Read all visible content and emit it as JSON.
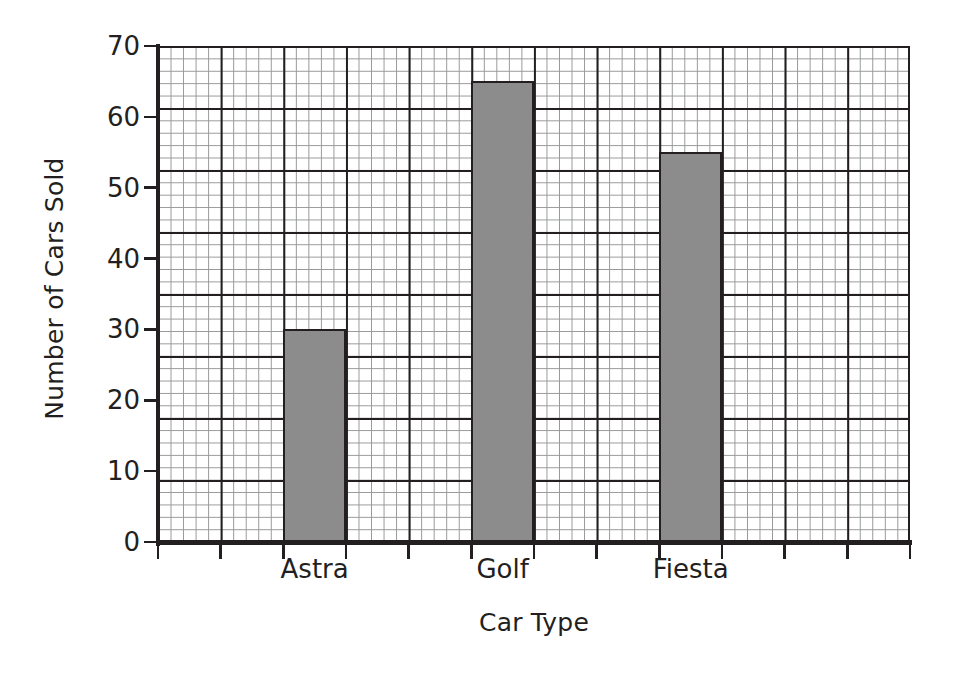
{
  "chart_data": {
    "type": "bar",
    "title": "",
    "xlabel": "Car Type",
    "ylabel": "Number of Cars Sold",
    "categories": [
      "Astra",
      "Golf",
      "Fiesta"
    ],
    "values": [
      30,
      65,
      55
    ],
    "ylim": [
      0,
      70
    ],
    "ytick_step": 10,
    "yticks": [
      0,
      10,
      20,
      30,
      40,
      50,
      60,
      70
    ],
    "ytick_labels": [
      "0",
      "10",
      "20",
      "30",
      "40",
      "50",
      "60",
      "70"
    ],
    "grid": "graph-paper",
    "grid_major_step": 10,
    "grid_minor_per_major": 5,
    "legend": "none",
    "bar_color": "#8c8c8c",
    "bar_edge_color": "#231f20",
    "axis_color": "#231f20",
    "grid_major_color": "#231f20",
    "grid_minor_color": "#58595b",
    "background_color": "#ffffff",
    "series": [
      {
        "name": "Number of Cars Sold",
        "values": [
          30,
          65,
          55
        ]
      }
    ],
    "bars": [
      {
        "category": "Astra",
        "value": 30,
        "value_label": "30"
      },
      {
        "category": "Golf",
        "value": 65,
        "value_label": "65"
      },
      {
        "category": "Fiesta",
        "value": 55,
        "value_label": "55"
      }
    ]
  }
}
